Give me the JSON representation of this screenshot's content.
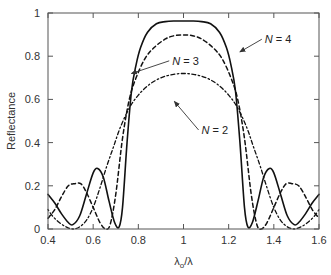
{
  "chart_data": {
    "type": "line",
    "title": "",
    "xlabel": "λo/λ",
    "xlabel_main": "λ",
    "xlabel_sub": "o",
    "xlabel_tail": "/λ",
    "ylabel": "Reflectance",
    "xlim": [
      0.4,
      1.6
    ],
    "ylim": [
      0,
      1
    ],
    "xticks": [
      0.4,
      0.6,
      0.8,
      1.0,
      1.2,
      1.4,
      1.6
    ],
    "xtick_labels": [
      "0.4",
      "0.6",
      "0.8",
      "1",
      "1.2",
      "1.4",
      "1.6"
    ],
    "yticks": [
      0,
      0.2,
      0.4,
      0.6,
      0.8,
      1.0
    ],
    "ytick_labels": [
      "0",
      "0.2",
      "0.4",
      "0.6",
      "0.8",
      "1"
    ],
    "grid": false,
    "legend": "none",
    "series": [
      {
        "name": "N = 4",
        "style": "solid",
        "x": [
          0.4,
          0.43,
          0.46,
          0.49,
          0.51,
          0.54,
          0.57,
          0.6,
          0.62,
          0.645,
          0.67,
          0.695,
          0.715,
          0.73,
          0.75,
          0.77,
          0.79,
          0.81,
          0.84,
          0.88,
          0.92,
          0.96,
          1.0,
          1.04,
          1.08,
          1.12,
          1.16,
          1.19,
          1.21,
          1.23,
          1.25,
          1.27,
          1.285,
          1.305,
          1.33,
          1.355,
          1.38,
          1.4,
          1.43,
          1.46,
          1.49,
          1.51,
          1.54,
          1.57,
          1.6
        ],
        "y": [
          0.16,
          0.12,
          0.07,
          0.03,
          0.02,
          0.06,
          0.16,
          0.26,
          0.28,
          0.24,
          0.13,
          0.03,
          0.01,
          0.1,
          0.4,
          0.64,
          0.76,
          0.84,
          0.91,
          0.95,
          0.96,
          0.963,
          0.963,
          0.963,
          0.96,
          0.95,
          0.91,
          0.84,
          0.76,
          0.64,
          0.4,
          0.1,
          0.01,
          0.03,
          0.13,
          0.24,
          0.28,
          0.26,
          0.16,
          0.06,
          0.02,
          0.03,
          0.07,
          0.12,
          0.16
        ]
      },
      {
        "name": "N = 3",
        "style": "dashed",
        "x": [
          0.4,
          0.43,
          0.46,
          0.49,
          0.52,
          0.545,
          0.57,
          0.6,
          0.63,
          0.655,
          0.675,
          0.7,
          0.73,
          0.76,
          0.79,
          0.83,
          0.87,
          0.92,
          0.96,
          1.0,
          1.04,
          1.08,
          1.13,
          1.17,
          1.21,
          1.24,
          1.27,
          1.3,
          1.325,
          1.345,
          1.37,
          1.4,
          1.43,
          1.455,
          1.48,
          1.51,
          1.54,
          1.57,
          1.6
        ],
        "y": [
          0.05,
          0.09,
          0.15,
          0.2,
          0.21,
          0.21,
          0.17,
          0.1,
          0.03,
          0.0,
          0.02,
          0.16,
          0.42,
          0.6,
          0.7,
          0.79,
          0.84,
          0.88,
          0.895,
          0.898,
          0.895,
          0.88,
          0.84,
          0.79,
          0.7,
          0.6,
          0.42,
          0.16,
          0.02,
          0.0,
          0.03,
          0.1,
          0.17,
          0.21,
          0.21,
          0.2,
          0.15,
          0.09,
          0.05
        ]
      },
      {
        "name": "N = 2",
        "style": "dash-dot",
        "x": [
          0.4,
          0.42,
          0.45,
          0.48,
          0.51,
          0.54,
          0.57,
          0.6,
          0.63,
          0.66,
          0.69,
          0.72,
          0.76,
          0.8,
          0.85,
          0.9,
          0.95,
          1.0,
          1.05,
          1.1,
          1.15,
          1.2,
          1.24,
          1.28,
          1.31,
          1.34,
          1.37,
          1.4,
          1.43,
          1.46,
          1.49,
          1.52,
          1.55,
          1.58,
          1.6
        ],
        "y": [
          0.09,
          0.06,
          0.03,
          0.01,
          0.0,
          0.01,
          0.04,
          0.1,
          0.19,
          0.29,
          0.38,
          0.47,
          0.56,
          0.62,
          0.67,
          0.7,
          0.715,
          0.72,
          0.715,
          0.7,
          0.67,
          0.62,
          0.56,
          0.47,
          0.38,
          0.29,
          0.19,
          0.1,
          0.04,
          0.01,
          0.0,
          0.01,
          0.03,
          0.06,
          0.09
        ]
      }
    ],
    "annotations": [
      {
        "text": "N = 4",
        "n_label": "N",
        "rest": " = 4",
        "text_at": [
          1.36,
          0.86
        ],
        "arrow_to": [
          1.25,
          0.82
        ]
      },
      {
        "text": "N = 3",
        "n_label": "N",
        "rest": " = 3",
        "text_at": [
          0.95,
          0.76
        ],
        "arrow_to": [
          0.77,
          0.72
        ]
      },
      {
        "text": "N = 2",
        "n_label": "N",
        "rest": " = 2",
        "text_at": [
          1.08,
          0.44
        ],
        "arrow_to": [
          0.96,
          0.59
        ]
      }
    ]
  }
}
